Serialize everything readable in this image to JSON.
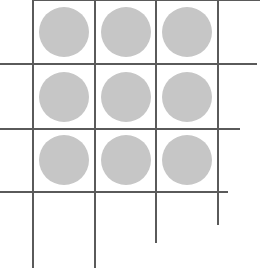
{
  "diagram": {
    "line_color": "#5a5a5a",
    "dot_color": "#c6c6c6",
    "background": "#ffffff",
    "vertical_lines": [
      {
        "x": 33,
        "y1": 0,
        "y2": 268
      },
      {
        "x": 95,
        "y1": 0,
        "y2": 268
      },
      {
        "x": 156,
        "y1": 0,
        "y2": 243
      },
      {
        "x": 218,
        "y1": 0,
        "y2": 225
      }
    ],
    "horizontal_lines": [
      {
        "y": 0,
        "x1": 33,
        "x2": 260
      },
      {
        "y": 64,
        "x1": 0,
        "x2": 257
      },
      {
        "y": 129,
        "x1": 0,
        "x2": 240
      },
      {
        "y": 192,
        "x1": 0,
        "x2": 228
      }
    ],
    "dots": [
      {
        "row": 0,
        "col": 0,
        "cx": 64,
        "cy": 32,
        "r": 25
      },
      {
        "row": 0,
        "col": 1,
        "cx": 126,
        "cy": 32,
        "r": 25
      },
      {
        "row": 0,
        "col": 2,
        "cx": 187,
        "cy": 32,
        "r": 25
      },
      {
        "row": 1,
        "col": 0,
        "cx": 64,
        "cy": 97,
        "r": 25
      },
      {
        "row": 1,
        "col": 1,
        "cx": 126,
        "cy": 97,
        "r": 25
      },
      {
        "row": 1,
        "col": 2,
        "cx": 187,
        "cy": 97,
        "r": 25
      },
      {
        "row": 2,
        "col": 0,
        "cx": 64,
        "cy": 160,
        "r": 25
      },
      {
        "row": 2,
        "col": 1,
        "cx": 126,
        "cy": 160,
        "r": 25
      },
      {
        "row": 2,
        "col": 2,
        "cx": 187,
        "cy": 160,
        "r": 25
      }
    ]
  }
}
